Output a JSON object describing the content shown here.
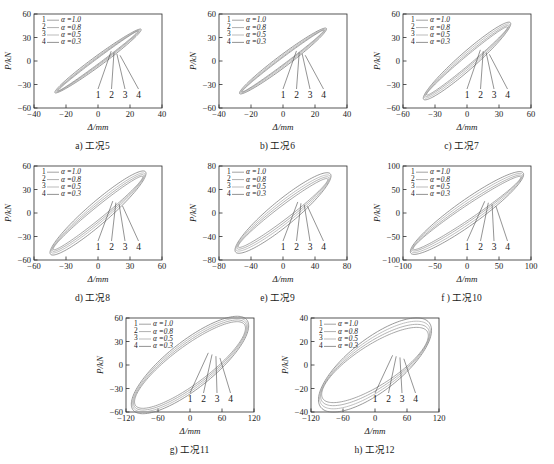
{
  "figure": {
    "type": "multi-panel-hysteresis",
    "background": "#ffffff",
    "axis_label_x": "Δ/mm",
    "axis_label_y": "P/kN",
    "legend_entries": [
      {
        "key": "1",
        "dash": "—",
        "text": "α =1.0",
        "alpha": 1.0,
        "color": "#8a8a8a"
      },
      {
        "key": "2",
        "dash": "—",
        "text": "α =0.8",
        "alpha": 0.8,
        "color": "#9a9a9a"
      },
      {
        "key": "3",
        "dash": "—",
        "text": "α =0.5",
        "alpha": 0.5,
        "color": "#aaaaaa"
      },
      {
        "key": "4",
        "dash": "—",
        "text": "α =0.3",
        "alpha": 0.3,
        "color": "#777777"
      }
    ],
    "curve_markers": [
      "1",
      "2",
      "3",
      "4"
    ]
  },
  "chart_data": [
    {
      "id": "a",
      "type": "line",
      "title": "a) 工况5",
      "caption": "a) 工况5",
      "xlabel": "Δ/mm",
      "ylabel": "P/kN",
      "xlim": [
        -40,
        40
      ],
      "ylim": [
        -60,
        60
      ],
      "xticks": [
        "-40",
        "-20",
        "0",
        "20",
        "40"
      ],
      "yticks": [
        "-60",
        "-30",
        "0",
        "30",
        "60"
      ],
      "series": [
        {
          "name": "1",
          "alpha": 1.0,
          "peak_disp": 25,
          "peak_force": 38,
          "width": 0.1
        },
        {
          "name": "2",
          "alpha": 0.8,
          "peak_disp": 25.6,
          "peak_force": 38.6,
          "width": 0.13
        },
        {
          "name": "3",
          "alpha": 0.5,
          "peak_disp": 26.2,
          "peak_force": 39.4,
          "width": 0.16
        },
        {
          "name": "4",
          "alpha": 0.3,
          "peak_disp": 27,
          "peak_force": 40,
          "width": 0.2
        }
      ]
    },
    {
      "id": "b",
      "type": "line",
      "title": "b) 工况6",
      "caption": "b) 工况6",
      "xlabel": "Δ/mm",
      "ylabel": "P/kN",
      "xlim": [
        -40,
        40
      ],
      "ylim": [
        -60,
        60
      ],
      "xticks": [
        "-40",
        "-20",
        "0",
        "20",
        "40"
      ],
      "yticks": [
        "-60",
        "-30",
        "0",
        "30",
        "60"
      ],
      "series": [
        {
          "name": "1",
          "alpha": 1.0,
          "peak_disp": 25.5,
          "peak_force": 39,
          "width": 0.12
        },
        {
          "name": "2",
          "alpha": 0.8,
          "peak_disp": 26,
          "peak_force": 39.6,
          "width": 0.15
        },
        {
          "name": "3",
          "alpha": 0.5,
          "peak_disp": 26.6,
          "peak_force": 40.4,
          "width": 0.19
        },
        {
          "name": "4",
          "alpha": 0.3,
          "peak_disp": 27.2,
          "peak_force": 41,
          "width": 0.23
        }
      ]
    },
    {
      "id": "c",
      "type": "line",
      "title": "c) 工况7",
      "caption": "c) 工况7",
      "xlabel": "Δ/mm",
      "ylabel": "P/kN",
      "xlim": [
        -60,
        60
      ],
      "ylim": [
        -60,
        60
      ],
      "xticks": [
        "-60",
        "-30",
        "0",
        "30",
        "60"
      ],
      "yticks": [
        "-60",
        "-30",
        "0",
        "30",
        "60"
      ],
      "series": [
        {
          "name": "1",
          "alpha": 1.0,
          "peak_disp": 38,
          "peak_force": 43,
          "width": 0.16
        },
        {
          "name": "2",
          "alpha": 0.8,
          "peak_disp": 39,
          "peak_force": 44.5,
          "width": 0.2
        },
        {
          "name": "3",
          "alpha": 0.5,
          "peak_disp": 40,
          "peak_force": 46,
          "width": 0.25
        },
        {
          "name": "4",
          "alpha": 0.3,
          "peak_disp": 41,
          "peak_force": 47.5,
          "width": 0.3
        }
      ]
    },
    {
      "id": "d",
      "type": "line",
      "title": "d) 工况8",
      "caption": "d) 工况8",
      "xlabel": "Δ/mm",
      "ylabel": "P/kN",
      "xlim": [
        -60,
        60
      ],
      "ylim": [
        -60,
        60
      ],
      "xticks": [
        "-60",
        "-30",
        "0",
        "30",
        "60"
      ],
      "yticks": [
        "-60",
        "-30",
        "0",
        "30",
        "60"
      ],
      "series": [
        {
          "name": "1",
          "alpha": 1.0,
          "peak_disp": 42,
          "peak_force": 46,
          "width": 0.2
        },
        {
          "name": "2",
          "alpha": 0.8,
          "peak_disp": 43,
          "peak_force": 47.5,
          "width": 0.25
        },
        {
          "name": "3",
          "alpha": 0.5,
          "peak_disp": 44,
          "peak_force": 49,
          "width": 0.3
        },
        {
          "name": "4",
          "alpha": 0.3,
          "peak_disp": 45,
          "peak_force": 50.5,
          "width": 0.36
        }
      ]
    },
    {
      "id": "e",
      "type": "line",
      "title": "e) 工况9",
      "caption": "e) 工况9",
      "xlabel": "Δ/mm",
      "ylabel": "P/kN",
      "xlim": [
        -80,
        80
      ],
      "ylim": [
        -80,
        80
      ],
      "xticks": [
        "-80",
        "-40",
        "0",
        "40",
        "80"
      ],
      "yticks": [
        "-80",
        "-40",
        "0",
        "40",
        "80"
      ],
      "series": [
        {
          "name": "1",
          "alpha": 1.0,
          "peak_disp": 56,
          "peak_force": 57,
          "width": 0.24
        },
        {
          "name": "2",
          "alpha": 0.8,
          "peak_disp": 57.5,
          "peak_force": 59,
          "width": 0.3
        },
        {
          "name": "3",
          "alpha": 0.5,
          "peak_disp": 59,
          "peak_force": 61,
          "width": 0.36
        },
        {
          "name": "4",
          "alpha": 0.3,
          "peak_disp": 60,
          "peak_force": 63,
          "width": 0.43
        }
      ]
    },
    {
      "id": "f",
      "type": "line",
      "title": "f ) 工况10",
      "caption": "f ) 工况10",
      "xlabel": "Δ/mm",
      "ylabel": "P/kN",
      "xlim": [
        -100,
        100
      ],
      "ylim": [
        -100,
        100
      ],
      "xticks": [
        "-100",
        "-50",
        "0",
        "50",
        "100"
      ],
      "yticks": [
        "-100",
        "-50",
        "0",
        "50",
        "100"
      ],
      "series": [
        {
          "name": "1",
          "alpha": 1.0,
          "peak_disp": 84,
          "peak_force": 76,
          "width": 0.22
        },
        {
          "name": "2",
          "alpha": 0.8,
          "peak_disp": 85.5,
          "peak_force": 78,
          "width": 0.27
        },
        {
          "name": "3",
          "alpha": 0.5,
          "peak_disp": 87,
          "peak_force": 80,
          "width": 0.33
        },
        {
          "name": "4",
          "alpha": 0.3,
          "peak_disp": 88.5,
          "peak_force": 82,
          "width": 0.39
        }
      ]
    },
    {
      "id": "g",
      "type": "line",
      "title": "g) 工况11",
      "caption": "g) 工况11",
      "xlabel": "Δ/mm",
      "ylabel": "P/kN",
      "xlim": [
        -120,
        120
      ],
      "ylim": [
        -60,
        60
      ],
      "xticks": [
        "-120",
        "-60",
        "0",
        "60",
        "120"
      ],
      "yticks": [
        "-60",
        "-30",
        "0",
        "30",
        "60"
      ],
      "series": [
        {
          "name": "1",
          "alpha": 1.0,
          "peak_disp": 104,
          "peak_force": 47,
          "width": 0.62
        },
        {
          "name": "2",
          "alpha": 0.8,
          "peak_disp": 106,
          "peak_force": 48,
          "width": 0.66
        },
        {
          "name": "3",
          "alpha": 0.5,
          "peak_disp": 108,
          "peak_force": 49,
          "width": 0.7
        },
        {
          "name": "4",
          "alpha": 0.3,
          "peak_disp": 110,
          "peak_force": 50,
          "width": 0.74
        }
      ]
    },
    {
      "id": "h",
      "type": "line",
      "title": "h) 工况12",
      "caption": "h) 工况12",
      "xlabel": "Δ/mm",
      "ylabel": "P/kN",
      "xlim": [
        -120,
        120
      ],
      "ylim": [
        -40,
        40
      ],
      "xticks": [
        "-120",
        "-60",
        "0",
        "60",
        "120"
      ],
      "yticks": [
        "-40",
        "-20",
        "0",
        "20",
        "40"
      ],
      "series": [
        {
          "name": "1",
          "alpha": 1.0,
          "peak_disp": 100,
          "peak_force": 25,
          "width": 0.8
        },
        {
          "name": "2",
          "alpha": 0.8,
          "peak_disp": 102,
          "peak_force": 26.5,
          "width": 0.84
        },
        {
          "name": "3",
          "alpha": 0.5,
          "peak_disp": 104,
          "peak_force": 28,
          "width": 0.88
        },
        {
          "name": "4",
          "alpha": 0.3,
          "peak_disp": 106,
          "peak_force": 29.5,
          "width": 0.92
        }
      ]
    }
  ]
}
